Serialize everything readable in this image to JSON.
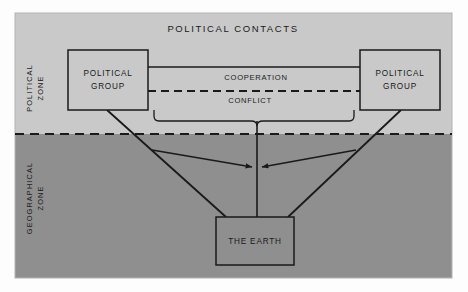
{
  "figure": {
    "title": "POLITICAL CONTACTS",
    "zones": {
      "upper": {
        "label_line1": "POLITICAL",
        "label_line2": "ZONE",
        "fill": "#c9c9c9"
      },
      "lower": {
        "label_line1": "GEOGRAPHICAL",
        "label_line2": "ZONE",
        "fill": "#8f8f8f"
      },
      "divider_style": "dashed"
    },
    "nodes": {
      "left_group": {
        "label_line1": "POLITICAL",
        "label_line2": "GROUP"
      },
      "right_group": {
        "label_line1": "POLITICAL",
        "label_line2": "GROUP"
      },
      "earth": {
        "label": "THE EARTH"
      }
    },
    "links": {
      "cooperation": {
        "label": "COOPERATION",
        "style": "solid"
      },
      "conflict": {
        "label": "CONFLICT",
        "style": "dashed"
      }
    },
    "colors": {
      "stroke": "#1a1a1a",
      "box_fill": "#c9c9c9",
      "box_fill_lower": "#8f8f8f",
      "frame": "#b3b3b3",
      "page": "#fdfdfd"
    }
  }
}
